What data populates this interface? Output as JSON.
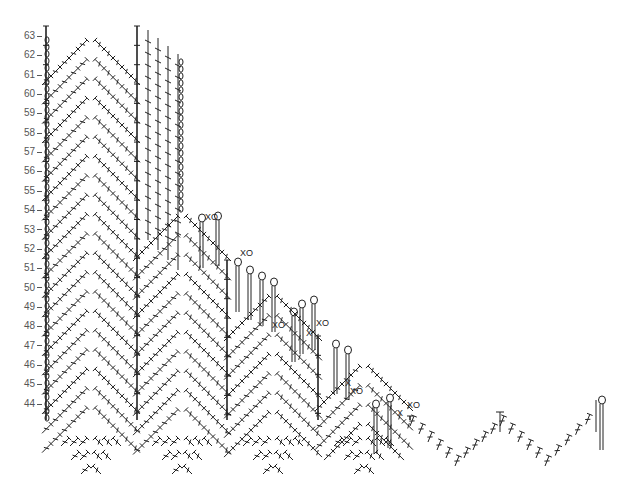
{
  "chart_title": "Crochet stitch chart",
  "rows": {
    "labels": [
      "63",
      "62",
      "61",
      "60",
      "59",
      "58",
      "57",
      "56",
      "55",
      "54",
      "53",
      "52",
      "51",
      "50",
      "49",
      "48",
      "47",
      "46",
      "45",
      "44"
    ],
    "top_y": 36,
    "step_y": 19.35
  },
  "colors": {
    "stroke": "#222222",
    "label": "#555555",
    "background": "#ffffff"
  },
  "symbols": {
    "dc": "double-crochet",
    "sc": "single-crochet-x",
    "ch": "chain-oval",
    "xo": "sc-and-chain",
    "loop": "chain-loop"
  },
  "annotations": [
    {
      "text": "XO",
      "x": 205,
      "y": 220
    },
    {
      "text": "XO",
      "x": 240,
      "y": 256
    },
    {
      "text": "XO",
      "x": 272,
      "y": 328
    },
    {
      "text": "XO",
      "x": 316,
      "y": 326
    },
    {
      "text": "X",
      "x": 306,
      "y": 336
    },
    {
      "text": "XO",
      "x": 350,
      "y": 394
    },
    {
      "text": "X",
      "x": 345,
      "y": 386
    },
    {
      "text": "X",
      "x": 397,
      "y": 416
    },
    {
      "text": "XO",
      "x": 407,
      "y": 408
    }
  ],
  "columns": [
    {
      "x": 46,
      "top": 26,
      "bottom": 420
    },
    {
      "x": 137,
      "top": 26,
      "bottom": 420
    },
    {
      "x": 227,
      "top": 260,
      "bottom": 420
    },
    {
      "x": 318,
      "top": 336,
      "bottom": 420
    },
    {
      "x": 410,
      "top": 416,
      "bottom": 420
    }
  ]
}
